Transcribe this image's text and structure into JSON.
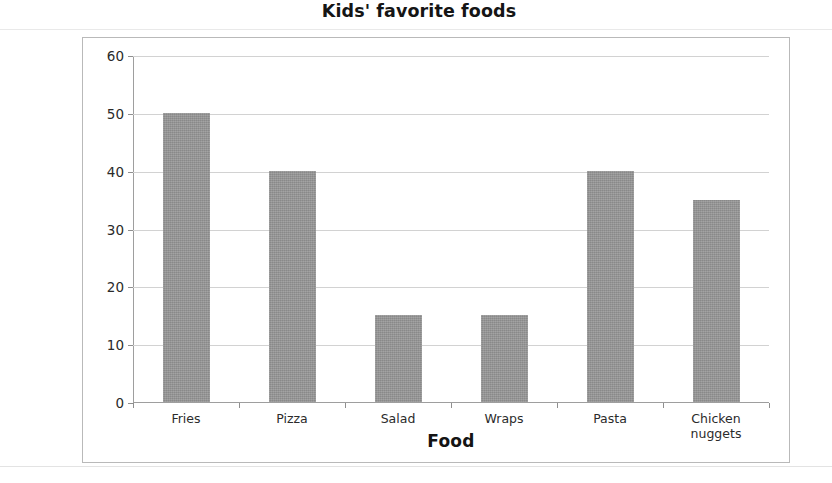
{
  "chart_data": {
    "type": "bar",
    "title": "Kids' favorite foods",
    "xlabel": "Food",
    "ylabel": "No. of kids",
    "categories": [
      "Fries",
      "Pizza",
      "Salad",
      "Wraps",
      "Pasta",
      "Chicken nuggets"
    ],
    "values": [
      50,
      40,
      15,
      15,
      40,
      35
    ],
    "ylim": [
      0,
      60
    ],
    "ytick_labels": [
      "60",
      "50",
      "40",
      "30",
      "20",
      "10",
      "0"
    ],
    "ytick_values": [
      60,
      50,
      40,
      30,
      20,
      10,
      0
    ],
    "ystep": 10,
    "grid": true,
    "legend": false,
    "bar_color": "#969696",
    "grid_color": "#d2d2d2",
    "axis_color": "#9e9e9e",
    "frame_color": "#b9b9b9",
    "background": "#ffffff"
  },
  "category_label_lines": [
    [
      "Fries"
    ],
    [
      "Pizza"
    ],
    [
      "Salad"
    ],
    [
      "Wraps"
    ],
    [
      "Pasta"
    ],
    [
      "Chicken",
      "nuggets"
    ]
  ]
}
